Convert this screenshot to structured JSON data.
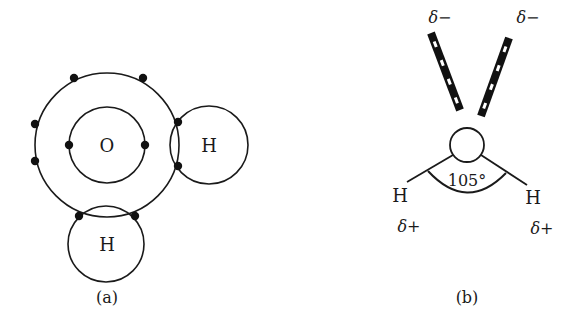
{
  "panel_a": {
    "caption": "(a)",
    "oxygen_label": "O",
    "hydrogen_right_label": "H",
    "hydrogen_bottom_label": "H",
    "inner_shell_electrons": 2,
    "outer_shell_electrons": 8
  },
  "panel_b": {
    "caption": "(b)",
    "bond_angle": "105°",
    "hydrogen_left_label": "H",
    "hydrogen_right_label": "H",
    "partial_charge_left_lone_pair": "δ−",
    "partial_charge_right_lone_pair": "δ−",
    "partial_charge_left_h": "δ+",
    "partial_charge_right_h": "δ+"
  },
  "colors": {
    "stroke": "#1a1a1a",
    "background": "#ffffff"
  }
}
